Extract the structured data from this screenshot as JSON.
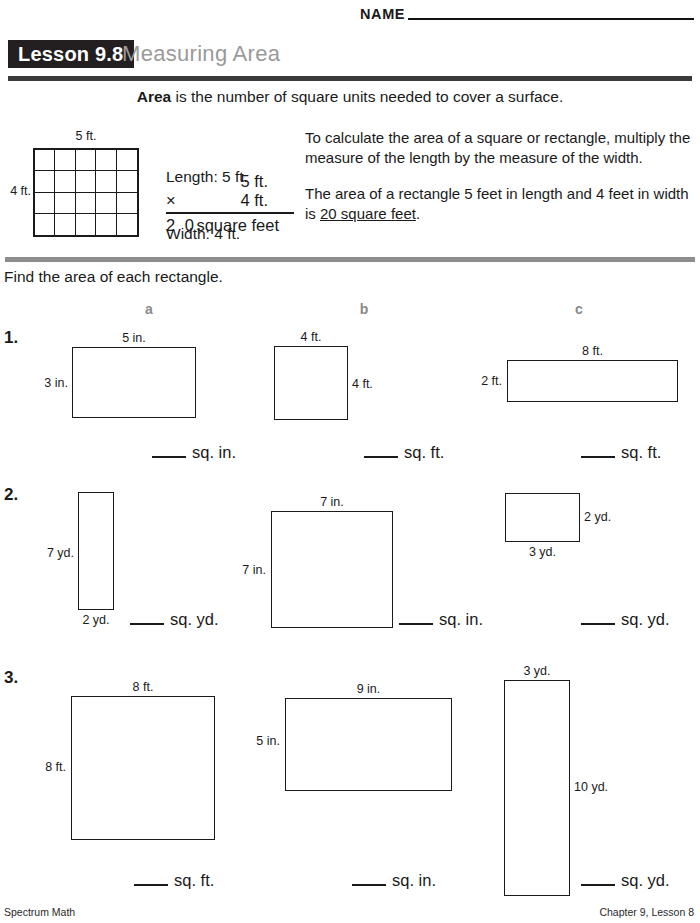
{
  "header": {
    "name_label": "NAME",
    "lesson_badge": "Lesson 9.8",
    "lesson_title": "Measuring Area"
  },
  "definition": {
    "bold_term": "Area",
    "rest": " is the number of square units needed to cover a surface."
  },
  "example": {
    "grid": {
      "top_label": "5 ft.",
      "left_label": "4 ft.",
      "cols": 5,
      "rows": 4
    },
    "length_line": "Length: 5 ft.",
    "width_line": "Width: 4 ft.",
    "mult_top": "5 ft.",
    "mult_sign": "×",
    "mult_bottom": "4 ft.",
    "product_number": "2 0",
    "product_unit": "square feet",
    "explain_1": "To calculate the area of a square or rectangle, multiply the measure of the length by the measure of the width.",
    "explain_2_pre": "The area of a rectangle 5 feet in length and 4 feet in width is ",
    "explain_2_underlined": "20 square feet",
    "explain_2_post": "."
  },
  "directions": "Find the area of each rectangle.",
  "columns": [
    "a",
    "b",
    "c"
  ],
  "problems": [
    {
      "number": "1.",
      "items": [
        {
          "top": "5 in.",
          "left": "3 in.",
          "right": "",
          "bottom": "",
          "answer_unit": "sq. in."
        },
        {
          "top": "4 ft.",
          "left": "",
          "right": "4 ft.",
          "bottom": "",
          "answer_unit": "sq. ft."
        },
        {
          "top": "8 ft.",
          "left": "2 ft.",
          "right": "",
          "bottom": "",
          "answer_unit": "sq. ft."
        }
      ]
    },
    {
      "number": "2.",
      "items": [
        {
          "top": "",
          "left": "7 yd.",
          "right": "",
          "bottom": "2 yd.",
          "answer_unit": "sq. yd."
        },
        {
          "top": "7 in.",
          "left": "7 in.",
          "right": "",
          "bottom": "",
          "answer_unit": "sq. in."
        },
        {
          "top": "",
          "left": "",
          "right": "2 yd.",
          "bottom": "3 yd.",
          "answer_unit": "sq. yd."
        }
      ]
    },
    {
      "number": "3.",
      "items": [
        {
          "top": "8 ft.",
          "left": "8 ft.",
          "right": "",
          "bottom": "",
          "answer_unit": "sq. ft."
        },
        {
          "top": "9 in.",
          "left": "5 in.",
          "right": "",
          "bottom": "",
          "answer_unit": "sq. in."
        },
        {
          "top": "3 yd.",
          "left": "",
          "right": "10 yd.",
          "bottom": "",
          "answer_unit": "sq. yd."
        }
      ]
    }
  ],
  "footer": {
    "left": "Spectrum Math",
    "right": "Chapter 9, Lesson 8"
  }
}
